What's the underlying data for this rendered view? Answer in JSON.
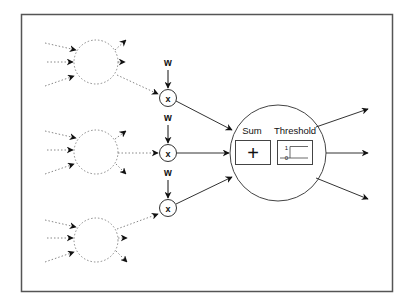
{
  "diagram": {
    "type": "neuron-model",
    "frame": {
      "x": 21,
      "y": 14,
      "width": 371,
      "height": 277,
      "stroke": "#555555"
    },
    "upstream_neurons": [
      {
        "id": "neuron-top",
        "cx": 96,
        "cy": 62,
        "r": 22
      },
      {
        "id": "neuron-middle",
        "cx": 96,
        "cy": 152,
        "r": 22
      },
      {
        "id": "neuron-bottom",
        "cx": 96,
        "cy": 240,
        "r": 22
      }
    ],
    "weights": [
      {
        "label": "w",
        "x": 168,
        "y": 66
      },
      {
        "label": "w",
        "x": 168,
        "y": 121
      },
      {
        "label": "w",
        "x": 168,
        "y": 176
      }
    ],
    "multipliers": [
      {
        "label": "x",
        "cx": 168,
        "cy": 98
      },
      {
        "label": "x",
        "cx": 168,
        "cy": 153
      },
      {
        "label": "x",
        "cx": 168,
        "cy": 208
      }
    ],
    "neuron": {
      "cx": 278,
      "cy": 153,
      "r": 48,
      "sum": {
        "label": "Sum",
        "symbol": "+"
      },
      "threshold": {
        "label": "Threshold",
        "high": "1",
        "low": "0"
      }
    },
    "colors": {
      "solid": "#333333",
      "dotted": "#888888",
      "arrow": "#111111"
    }
  }
}
